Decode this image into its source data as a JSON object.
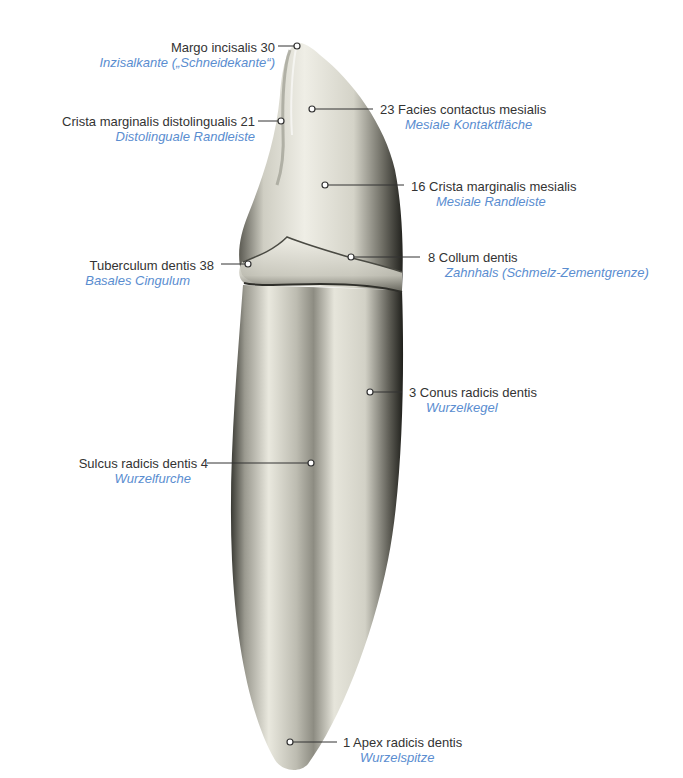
{
  "figure": {
    "colors": {
      "latin_text": "#333333",
      "german_text": "#5a8dd0",
      "leader_line": "#333333",
      "tooth_light": "#f1f0e8",
      "tooth_dark": "#2a2a26"
    },
    "labels": [
      {
        "id": "margo-incisalis",
        "number": "30",
        "latin": "Margo incisalis",
        "german": "Inzisalkante („Schneidekante“)",
        "side": "left"
      },
      {
        "id": "crista-marginalis-distolingualis",
        "number": "21",
        "latin": "Crista marginalis distolingualis",
        "german": "Distolinguale Randleiste",
        "side": "left"
      },
      {
        "id": "facies-contactus-mesialis",
        "number": "23",
        "latin": "Facies contactus mesialis",
        "german": "Mesiale Kontaktfläche",
        "side": "right"
      },
      {
        "id": "crista-marginalis-mesialis",
        "number": "16",
        "latin": "Crista marginalis mesialis",
        "german": "Mesiale Randleiste",
        "side": "right"
      },
      {
        "id": "tuberculum-dentis",
        "number": "38",
        "latin": "Tuberculum dentis",
        "german": "Basales Cingulum",
        "side": "left"
      },
      {
        "id": "collum-dentis",
        "number": "8",
        "latin": "Collum dentis",
        "german": "Zahnhals (Schmelz-Zementgrenze)",
        "side": "right"
      },
      {
        "id": "conus-radicis-dentis",
        "number": "3",
        "latin": "Conus radicis dentis",
        "german": "Wurzelkegel",
        "side": "right"
      },
      {
        "id": "sulcus-radicis-dentis",
        "number": "4",
        "latin": "Sulcus radicis dentis",
        "german": "Wurzelfurche",
        "side": "left"
      },
      {
        "id": "apex-radicis-dentis",
        "number": "1",
        "latin": "Apex radicis dentis",
        "german": "Wurzelspitze",
        "side": "right"
      }
    ]
  },
  "text": {
    "l30_latin": "Margo incisalis  30",
    "l30_german": "Inzisalkante („Schneidekante“)",
    "l21_latin": "Crista marginalis distolingualis  21",
    "l21_german": "Distolinguale Randleiste",
    "l23_latin": "23  Facies contactus mesialis",
    "l23_german": "Mesiale Kontaktfläche",
    "l16_latin": "16  Crista marginalis mesialis",
    "l16_german": "Mesiale Randleiste",
    "l38_latin": "Tuberculum dentis  38",
    "l38_german": "Basales Cingulum",
    "l8_latin": "8  Collum dentis",
    "l8_german": "Zahnhals (Schmelz-Zementgrenze)",
    "l3_latin": "3  Conus radicis dentis",
    "l3_german": "Wurzelkegel",
    "l4_latin": "Sulcus radicis dentis  4",
    "l4_german": "Wurzelfurche",
    "l1_latin": "1  Apex radicis dentis",
    "l1_german": "Wurzelspitze"
  }
}
